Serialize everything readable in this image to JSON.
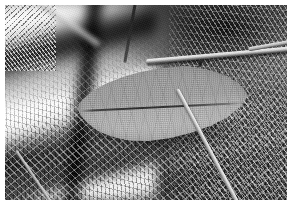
{
  "image": {
    "kind": "photograph",
    "subject": "leaf-on-forest-floor",
    "color_mode": "grayscale",
    "caption": "",
    "border": {
      "style": "white-margin",
      "color": "#ffffff",
      "width_px": 5
    },
    "canvas": {
      "width_px": 291,
      "height_px": 204
    },
    "plate": {
      "width_px": 282,
      "height_px": 195
    }
  },
  "palette": {
    "border_white": "#ffffff",
    "highlight_white": "#fafafa",
    "leaf_upper_gray": "#9e9e9e",
    "leaf_lower_gray": "#b4b4b4",
    "midrib_dark": "#2e2e2e",
    "background_mid_gray": "#5a5a5a",
    "shadow_black": "#0a0a0a",
    "litter_light": "#e6e6e6"
  },
  "elements": {
    "leaf": {
      "label": "leaf",
      "shape": "elliptic-lanceolate",
      "orientation": "horizontal",
      "focus": "sharp",
      "tone": "mid-gray",
      "midrib": {
        "label": "midrib",
        "tone": "dark",
        "orientation": "near-horizontal"
      },
      "veins": {
        "label": "lateral-veins",
        "visibility": "faint"
      },
      "notch": {
        "label": "edge-notch",
        "tone": "dark",
        "position": "upper-right-margin"
      },
      "shadow": {
        "label": "cast-shadow",
        "position": "beneath-leaf"
      }
    },
    "background": {
      "label": "forest-floor-background",
      "blurred_stems": {
        "label": "out-of-focus-stems",
        "region": "left",
        "tone": "alternating-bright-and-dark",
        "direction": "upper-left-to-lower-right"
      },
      "dark_shadow_bar": {
        "label": "shadow-band",
        "region": "left-of-center"
      },
      "litter": {
        "label": "leaf-litter-texture",
        "region": "lower-and-right"
      },
      "foliage_clump": {
        "label": "bright-foliage",
        "region": "top-right"
      },
      "dark_mass": {
        "label": "dark-background-mass",
        "region": "upper-right"
      }
    },
    "twigs": [
      {
        "label": "upper-twig",
        "region": "upper-right",
        "focus": "sharp",
        "tone": "bright"
      },
      {
        "label": "upper-twig-extension",
        "region": "far-right",
        "focus": "sharp",
        "tone": "bright"
      },
      {
        "label": "diagonal-stick",
        "region": "right-below-leaf",
        "focus": "sharp",
        "tone": "bright"
      },
      {
        "label": "lower-left-stick",
        "region": "lower-left",
        "focus": "soft",
        "tone": "bright"
      },
      {
        "label": "upper-left-twig",
        "region": "upper-left",
        "focus": "blurred",
        "tone": "bright"
      },
      {
        "label": "dark-stem",
        "region": "top-center",
        "focus": "blurred",
        "tone": "dark"
      }
    ]
  }
}
